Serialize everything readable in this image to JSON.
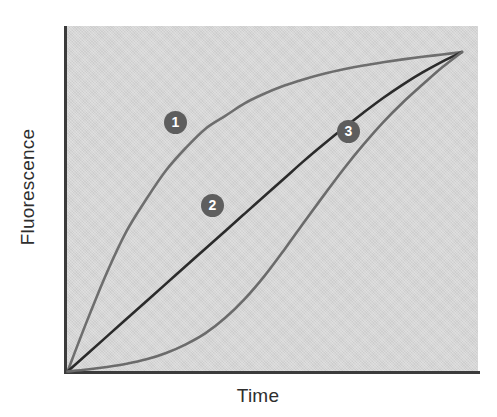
{
  "chart_data": {
    "type": "line",
    "title": "",
    "subtitle": "",
    "xlabel": "Time",
    "ylabel": "Fluorescence",
    "x": [
      0,
      0.05,
      0.1,
      0.15,
      0.2,
      0.25,
      0.3,
      0.35,
      0.4,
      0.45,
      0.5,
      0.55,
      0.6,
      0.65,
      0.7,
      0.75,
      0.8,
      0.85,
      0.9,
      0.95,
      1.0
    ],
    "xlim": [
      0,
      1
    ],
    "ylim": [
      0,
      1
    ],
    "grid": false,
    "legend_position": "inline-labels",
    "axis_ticks": {
      "x": [],
      "y": []
    },
    "series": [
      {
        "name": "1",
        "label": "1",
        "color": "#6e6e6e",
        "description": "fast-rising curve reaching plateau earliest",
        "values": [
          0.0,
          0.16,
          0.31,
          0.44,
          0.54,
          0.63,
          0.7,
          0.76,
          0.8,
          0.84,
          0.87,
          0.895,
          0.915,
          0.932,
          0.946,
          0.958,
          0.968,
          0.977,
          0.985,
          0.992,
          1.0
        ]
      },
      {
        "name": "2",
        "label": "2",
        "color": "#2b2b2b",
        "description": "near-linear intermediate curve",
        "values": [
          0.0,
          0.055,
          0.11,
          0.165,
          0.22,
          0.275,
          0.33,
          0.385,
          0.44,
          0.495,
          0.55,
          0.605,
          0.66,
          0.712,
          0.762,
          0.81,
          0.856,
          0.898,
          0.936,
          0.97,
          1.0
        ]
      },
      {
        "name": "3",
        "label": "3",
        "color": "#6b6b6b",
        "description": "lagging sigmoidal curve with long initial lag phase",
        "values": [
          0.0,
          0.006,
          0.014,
          0.024,
          0.038,
          0.058,
          0.085,
          0.12,
          0.168,
          0.228,
          0.3,
          0.382,
          0.468,
          0.552,
          0.634,
          0.71,
          0.78,
          0.842,
          0.898,
          0.952,
          1.0
        ]
      }
    ],
    "annotations": [
      {
        "label": "1",
        "x": 0.255,
        "y": 0.745,
        "style": "circle-badge"
      },
      {
        "label": "2",
        "x": 0.345,
        "y": 0.505,
        "style": "circle-badge"
      },
      {
        "label": "3",
        "x": 0.675,
        "y": 0.715,
        "style": "circle-badge"
      }
    ],
    "colors": {
      "panel_background": "#d5d5d5",
      "page_background": "#ffffff",
      "axis": "#3b3b3b",
      "badge_fill": "#5e5e5e",
      "badge_text": "#ffffff",
      "label_text": "#2e2e2e"
    }
  }
}
